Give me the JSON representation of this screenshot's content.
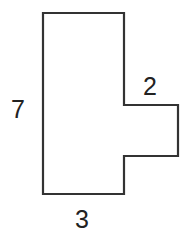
{
  "diagram": {
    "type": "rectilinear-composite-shape",
    "stroke_color": "#333333",
    "labels": {
      "height": "7",
      "tab_width": "2",
      "base_width": "3"
    },
    "outline_points": [
      [
        43,
        13
      ],
      [
        124,
        13
      ],
      [
        124,
        105
      ],
      [
        178,
        105
      ],
      [
        178,
        156
      ],
      [
        124,
        156
      ],
      [
        124,
        194
      ],
      [
        43,
        194
      ]
    ]
  }
}
